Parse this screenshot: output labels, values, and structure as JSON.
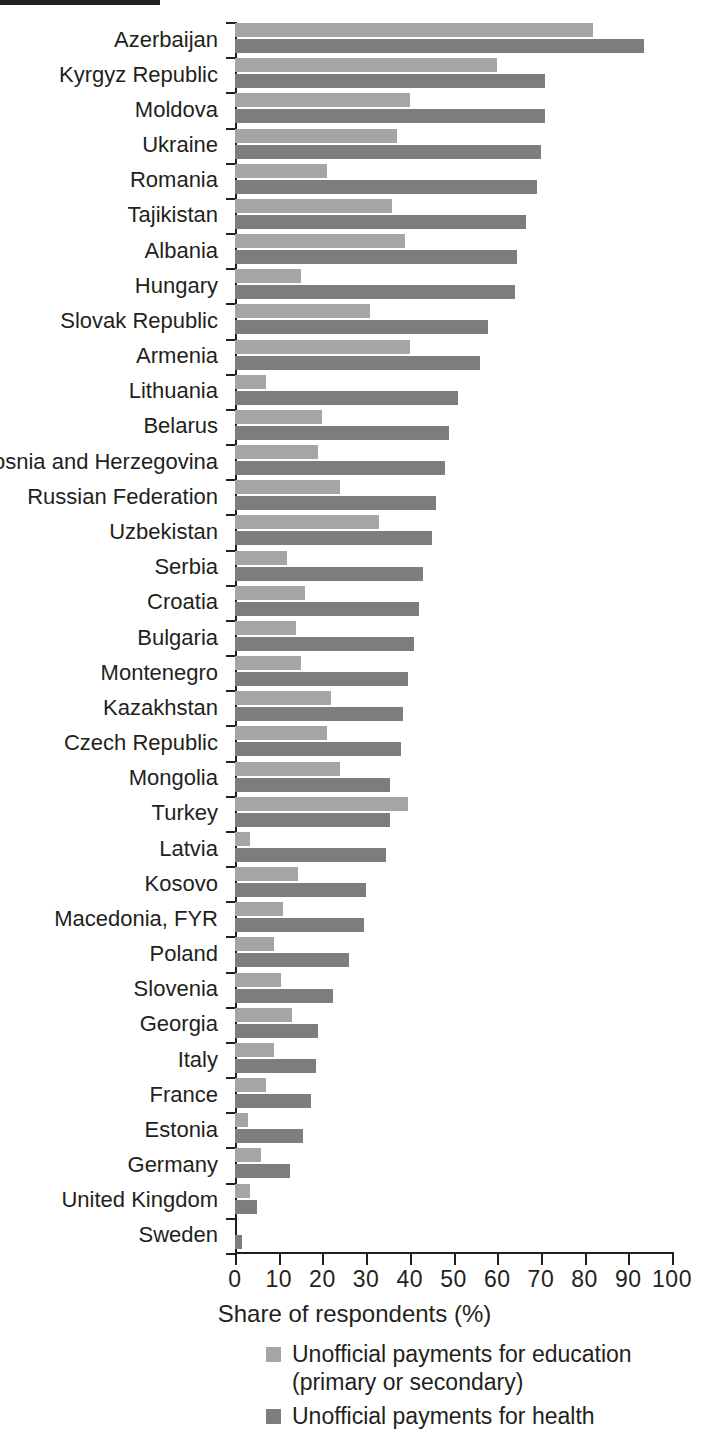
{
  "chart_data": {
    "type": "bar",
    "orientation": "horizontal",
    "title": "",
    "xlabel": "Share of respondents (%)",
    "ylabel": "",
    "xlim": [
      0,
      100
    ],
    "xticks": [
      0,
      10,
      20,
      30,
      40,
      50,
      60,
      70,
      80,
      90,
      100
    ],
    "grid": false,
    "legend_position": "bottom",
    "categories": [
      "Azerbaijan",
      "Kyrgyz Republic",
      "Moldova",
      "Ukraine",
      "Romania",
      "Tajikistan",
      "Albania",
      "Hungary",
      "Slovak Republic",
      "Armenia",
      "Lithuania",
      "Belarus",
      "Bosnia and Herzegovina",
      "Russian Federation",
      "Uzbekistan",
      "Serbia",
      "Croatia",
      "Bulgaria",
      "Montenegro",
      "Kazakhstan",
      "Czech Republic",
      "Mongolia",
      "Turkey",
      "Latvia",
      "Kosovo",
      "Macedonia, FYR",
      "Poland",
      "Slovenia",
      "Georgia",
      "Italy",
      "France",
      "Estonia",
      "Germany",
      "United Kingdom",
      "Sweden"
    ],
    "series": [
      {
        "name": "Unofficial payments for education (primary or secondary)",
        "color": "#a5a5a5",
        "values": [
          82,
          60,
          40,
          37,
          21,
          36,
          39,
          15,
          31,
          40,
          7,
          20,
          19,
          24,
          33,
          12,
          16,
          14,
          15,
          22,
          21,
          24,
          39.5,
          3.5,
          14.5,
          11,
          9,
          10.5,
          13,
          9,
          7,
          3,
          6,
          3.5,
          0
        ]
      },
      {
        "name": "Unofficial payments for health",
        "color": "#7d7d7d",
        "values": [
          93.5,
          71,
          71,
          70,
          69,
          66.5,
          64.5,
          64,
          58,
          56,
          51,
          49,
          48,
          46,
          45,
          43,
          42,
          41,
          39.5,
          38.5,
          38,
          35.5,
          35.5,
          34.5,
          30,
          29.5,
          26,
          22.5,
          19,
          18.5,
          17.5,
          15.5,
          12.5,
          5,
          1.5
        ]
      }
    ]
  },
  "axis": {
    "x_title": "Share of respondents (%)"
  },
  "legend": {
    "items": [
      {
        "label": "Unofficial payments for education",
        "sublabel": "(primary or secondary)",
        "swatch": "light-gray-swatch"
      },
      {
        "label": "Unofficial payments for health",
        "sublabel": "",
        "swatch": "dark-gray-swatch"
      }
    ]
  },
  "colors": {
    "education": "#a5a5a5",
    "health": "#7d7d7d",
    "axis": "#231f20",
    "text": "#231f20"
  }
}
